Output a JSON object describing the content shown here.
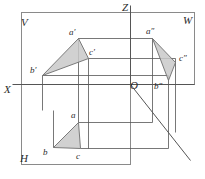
{
  "figure": {
    "type": "descriptive-geometry-three-plane-projection",
    "width": 205,
    "height": 179,
    "colors": {
      "line": "#555555",
      "frame": "#8a8a8a",
      "triangle_fill": "#c9c9c9",
      "triangle_stroke": "#6e6e6e",
      "label": "#2b2b2b",
      "background": "#ffffff"
    }
  },
  "planes": [
    {
      "id": "V",
      "label": "V",
      "name": "frontal-plane",
      "x": 21,
      "y": 17
    },
    {
      "id": "W",
      "label": "W",
      "name": "profile-plane",
      "x": 183,
      "y": 15
    },
    {
      "id": "H",
      "label": "H",
      "name": "horizontal-plane",
      "x": 20,
      "y": 153
    }
  ],
  "axes": [
    {
      "id": "X",
      "label": "X",
      "name": "x-axis",
      "x": 4,
      "y": 84
    },
    {
      "id": "Z",
      "label": "Z",
      "name": "z-axis",
      "x": 122,
      "y": 2
    },
    {
      "id": "Y",
      "label": "",
      "name": "y-axis",
      "x": 0,
      "y": 0
    }
  ],
  "origin": {
    "label": "O",
    "name": "origin",
    "x": 130,
    "y": 80
  },
  "projections": {
    "frontal": {
      "name": "v-projection-triangle",
      "points": [
        {
          "label": "a′",
          "name": "point-a-prime",
          "px": 78,
          "py": 38,
          "lx": 69,
          "ly": 28
        },
        {
          "label": "b′",
          "name": "point-b-prime",
          "px": 42,
          "py": 75,
          "lx": 30,
          "ly": 66
        },
        {
          "label": "c′",
          "name": "point-c-prime",
          "px": 88,
          "py": 58,
          "lx": 89,
          "ly": 48
        }
      ]
    },
    "profile": {
      "name": "w-projection-triangle",
      "points": [
        {
          "label": "a″",
          "name": "point-a-double-prime",
          "px": 152,
          "py": 38,
          "lx": 146,
          "ly": 27
        },
        {
          "label": "b″",
          "name": "point-b-double-prime",
          "px": 168,
          "py": 80,
          "lx": 154,
          "ly": 82
        },
        {
          "label": "c″",
          "name": "point-c-double-prime",
          "px": 175,
          "py": 62,
          "lx": 179,
          "ly": 54
        }
      ]
    },
    "horizontal": {
      "name": "h-projection-triangle",
      "points": [
        {
          "label": "a",
          "name": "point-a",
          "px": 78,
          "py": 122,
          "lx": 71,
          "ly": 111
        },
        {
          "label": "b",
          "name": "point-b",
          "px": 53,
          "py": 147,
          "lx": 43,
          "ly": 148
        },
        {
          "label": "c",
          "name": "point-c",
          "px": 80,
          "py": 148,
          "lx": 76,
          "ly": 152
        }
      ]
    }
  },
  "geometry": {
    "frame": {
      "v_plane_rect": {
        "x": 21,
        "y": 12,
        "w": 109,
        "h": 72
      },
      "w_plane_rect": {
        "x": 130,
        "y": 12,
        "w": 64,
        "h": 72
      },
      "h_plane_rect": {
        "x": 21,
        "y": 84,
        "w": 109,
        "h": 80
      },
      "x_axis": {
        "x1": 12,
        "y1": 84,
        "x2": 194,
        "y2": 84
      },
      "z_axis": {
        "x1": 130,
        "y1": 5,
        "x2": 130,
        "y2": 84
      },
      "y_axis": {
        "x1": 130,
        "y1": 84,
        "x2": 190,
        "y2": 160
      }
    },
    "box_edges": [
      {
        "x1": 78,
        "y1": 38,
        "x2": 152,
        "y2": 38
      },
      {
        "x1": 88,
        "y1": 58,
        "x2": 175,
        "y2": 58
      },
      {
        "x1": 42,
        "y1": 75,
        "x2": 168,
        "y2": 75
      },
      {
        "x1": 78,
        "y1": 38,
        "x2": 78,
        "y2": 122
      },
      {
        "x1": 88,
        "y1": 58,
        "x2": 88,
        "y2": 148
      },
      {
        "x1": 42,
        "y1": 75,
        "x2": 42,
        "y2": 110
      },
      {
        "x1": 78,
        "y1": 122,
        "x2": 152,
        "y2": 122
      },
      {
        "x1": 80,
        "y1": 148,
        "x2": 168,
        "y2": 148
      },
      {
        "x1": 53,
        "y1": 147,
        "x2": 53,
        "y2": 110
      },
      {
        "x1": 152,
        "y1": 38,
        "x2": 152,
        "y2": 122
      },
      {
        "x1": 168,
        "y1": 75,
        "x2": 168,
        "y2": 148
      },
      {
        "x1": 175,
        "y1": 58,
        "x2": 175,
        "y2": 132
      }
    ]
  }
}
